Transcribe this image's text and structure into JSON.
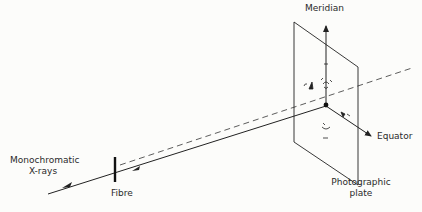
{
  "diagram": {
    "type": "fibre-xray-diffraction-geometry",
    "labels": {
      "meridian": "Meridian",
      "equator": "Equator",
      "source_line1": "Monochromatic",
      "source_line2": "X-rays",
      "fibre": "Fibre",
      "plate_line1": "Photographic",
      "plate_line2": "plate"
    },
    "colors": {
      "line": "#222222",
      "background": "#fcfcfa",
      "text": "#2a2a2a"
    }
  }
}
